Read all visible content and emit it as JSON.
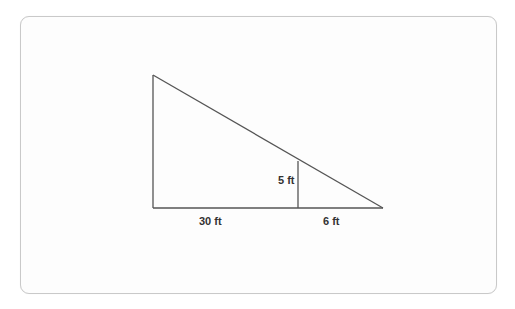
{
  "figure": {
    "type": "similar-triangles",
    "labels": {
      "long_base": "30 ft",
      "short_base": "6 ft",
      "inner_height": "5 ft"
    },
    "geometry": {
      "top_vertex": [
        153,
        75
      ],
      "bottom_left": [
        153,
        208
      ],
      "bottom_right": [
        383,
        208
      ],
      "inner_segment_top": [
        298,
        161
      ],
      "inner_segment_bottom": [
        298,
        208
      ]
    },
    "colors": {
      "stroke": "#555555",
      "text": "#333333",
      "card_border": "#c9c9c9"
    }
  }
}
